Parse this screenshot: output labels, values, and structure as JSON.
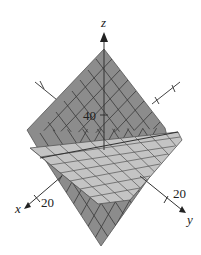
{
  "figure": {
    "type": "3d-surface-plot",
    "axes": {
      "x": {
        "label": "x",
        "tick": "20"
      },
      "y": {
        "label": "y",
        "tick": "20"
      },
      "z": {
        "label": "z",
        "tick": "40"
      }
    },
    "surfaces": [
      {
        "name": "steep-plane",
        "color": "#8c8c8c"
      },
      {
        "name": "flat-plane",
        "color": "#c4c4c4"
      }
    ],
    "colors": {
      "axis": "#333333",
      "grid": "#3a3a3a",
      "background": "#ffffff"
    }
  }
}
